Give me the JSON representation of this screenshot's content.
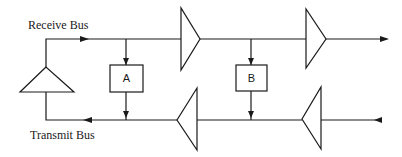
{
  "diagram": {
    "type": "bus-repeater-block-diagram",
    "labels": {
      "receive_bus": "Receive Bus",
      "transmit_bus": "Transmit Bus"
    },
    "boxes": [
      {
        "id": "A",
        "label": "A"
      },
      {
        "id": "B",
        "label": "B"
      }
    ],
    "amplifiers": [
      {
        "name": "loopback-amplifier",
        "direction": "up"
      },
      {
        "name": "receive-amplifier-1",
        "direction": "right"
      },
      {
        "name": "receive-amplifier-2",
        "direction": "right"
      },
      {
        "name": "transmit-amplifier-1",
        "direction": "left"
      },
      {
        "name": "transmit-amplifier-2",
        "direction": "left"
      }
    ],
    "colors": {
      "stroke": "#1a1a1a",
      "background": "#ffffff"
    }
  }
}
